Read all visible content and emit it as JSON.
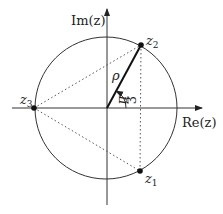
{
  "diagram": {
    "axes": {
      "x_label": "Re(z)",
      "y_label": "Im(z)"
    },
    "points": [
      {
        "name": "z1",
        "label": "z",
        "sub": "1"
      },
      {
        "name": "z2",
        "label": "z",
        "sub": "2"
      },
      {
        "name": "z3",
        "label": "z",
        "sub": "3"
      }
    ],
    "radius_label": "ρ",
    "angle_label": {
      "num": "π",
      "den": "3"
    },
    "colors": {
      "line": "#222222",
      "dotted": "#555555",
      "background": "#ffffff"
    }
  }
}
